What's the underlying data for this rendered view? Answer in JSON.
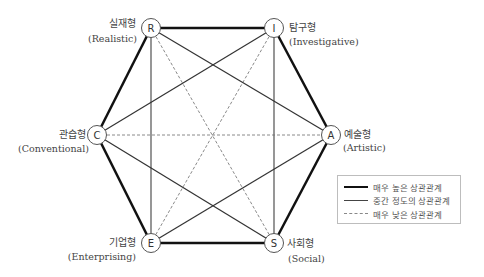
{
  "nodes": {
    "R": {
      "letter": "R",
      "ko": "실재형",
      "en": "(Realistic)"
    },
    "I": {
      "letter": "I",
      "ko": "탐구형",
      "en": "(Investigative)"
    },
    "A": {
      "letter": "A",
      "ko": "예술형",
      "en": "(Artistic)"
    },
    "S": {
      "letter": "S",
      "ko": "사회형",
      "en": "(Social)"
    },
    "E": {
      "letter": "E",
      "ko": "기업형",
      "en": "(Enterprising)"
    },
    "C": {
      "letter": "C",
      "ko": "관습형",
      "en": "(Conventional)"
    }
  },
  "edges": {
    "high": [
      [
        "R",
        "I"
      ],
      [
        "I",
        "A"
      ],
      [
        "A",
        "S"
      ],
      [
        "S",
        "E"
      ],
      [
        "E",
        "C"
      ],
      [
        "C",
        "R"
      ]
    ],
    "medium": [
      [
        "R",
        "E"
      ],
      [
        "I",
        "S"
      ],
      [
        "R",
        "A"
      ],
      [
        "I",
        "C"
      ],
      [
        "C",
        "S"
      ],
      [
        "A",
        "E"
      ]
    ],
    "low": [
      [
        "R",
        "S"
      ],
      [
        "I",
        "E"
      ],
      [
        "C",
        "A"
      ]
    ]
  },
  "legend": {
    "high": "매우 높은 상관관계",
    "medium": "중간 정도의 상관관계",
    "low": "매우 낮은 상관관계"
  }
}
